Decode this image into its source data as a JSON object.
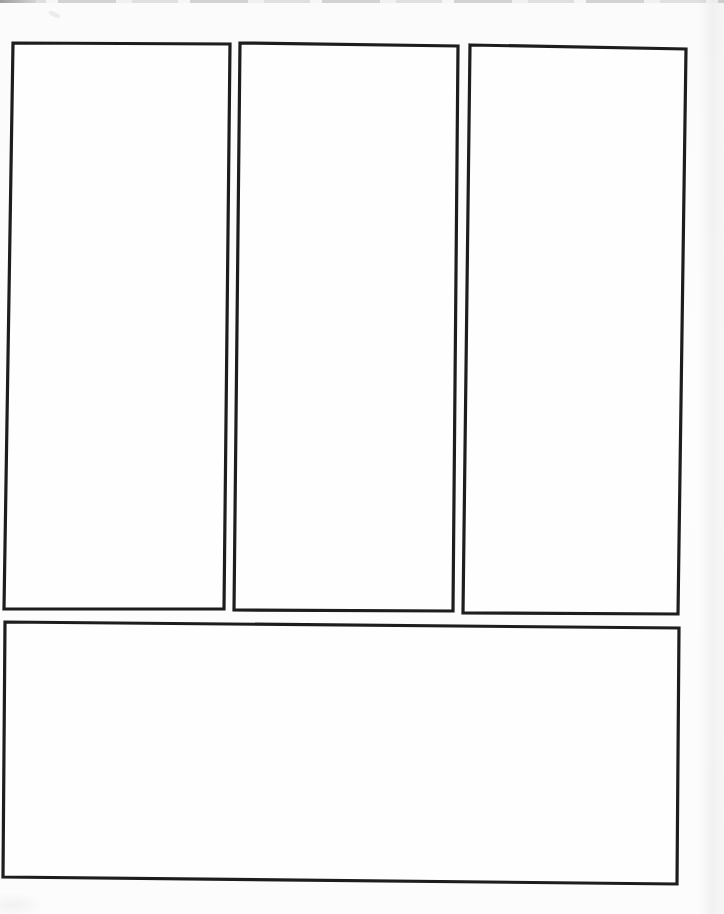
{
  "page": {
    "type": "scanned-blank-comic-page",
    "background_color": "#fcfcfc",
    "panel_fill_color": "#fefefe",
    "panel_border_color": "#1d1d1d",
    "panel_border_width": 3.2,
    "panel_count": 4,
    "panels": [
      {
        "id": "panel-1",
        "position": "top-left",
        "shape": "tall-rectangle",
        "content": "",
        "points": "13,43 230,44 224,609 4,609"
      },
      {
        "id": "panel-2",
        "position": "top-center",
        "shape": "tall-rectangle",
        "content": "",
        "points": "240,43 458,46 453,611 234,610"
      },
      {
        "id": "panel-3",
        "position": "top-right",
        "shape": "tall-rectangle",
        "content": "",
        "points": "470,45 686,49 678,614 463,613"
      },
      {
        "id": "panel-4",
        "position": "bottom",
        "shape": "wide-rectangle",
        "content": "",
        "points": "5,622 679,628 677,884 3,877"
      }
    ],
    "artifacts": {
      "top_edge_scan_line": "faint broken gray line along top edge",
      "right_edge_shading": "subtle light-gray vertical scan shading",
      "note": "all panels are empty"
    }
  }
}
